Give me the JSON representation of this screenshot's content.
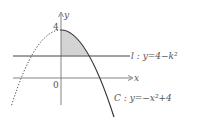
{
  "diagram": {
    "axes": {
      "x_label": "x",
      "y_label": "y",
      "origin_label": "0",
      "y_intercept_label": "4"
    },
    "line_l": {
      "name": "l",
      "label": "l : y=4−k²"
    },
    "curve_C": {
      "name": "C",
      "label": "C : y=−x²+4"
    },
    "shaded_region": "region between C, line l and y-axis for x ≥ 0",
    "colors": {
      "stroke": "#333333",
      "shade": "#d4d4d4",
      "text": "#555555"
    }
  }
}
